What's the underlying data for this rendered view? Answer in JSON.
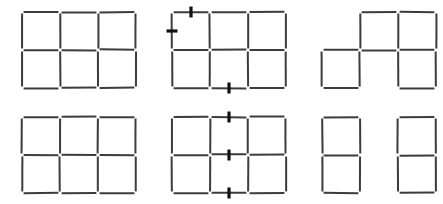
{
  "figure": {
    "title": "",
    "background": "#ffffff",
    "stick_color": "#3c3c3c",
    "mark_color": "#111111",
    "rows": 2,
    "columns": 3,
    "panel_labels": [
      "",
      "",
      "",
      "",
      "",
      ""
    ]
  },
  "geometry": {
    "cell": 38,
    "stick_width": 2.0,
    "mark_width": 3.2,
    "mark_length": 11,
    "panel_positions": [
      {
        "x": 18,
        "y": 8
      },
      {
        "x": 168,
        "y": 8
      },
      {
        "x": 318,
        "y": 8
      },
      {
        "x": 18,
        "y": 113
      },
      {
        "x": 168,
        "y": 113
      },
      {
        "x": 318,
        "y": 113
      }
    ]
  },
  "panels": [
    {
      "name": "start-grid-top",
      "caption": "",
      "horizontals": [
        {
          "row": 0,
          "col": 0
        },
        {
          "row": 0,
          "col": 1
        },
        {
          "row": 0,
          "col": 2
        },
        {
          "row": 1,
          "col": 0
        },
        {
          "row": 1,
          "col": 1
        },
        {
          "row": 1,
          "col": 2
        },
        {
          "row": 2,
          "col": 0
        },
        {
          "row": 2,
          "col": 1
        },
        {
          "row": 2,
          "col": 2
        }
      ],
      "verticals": [
        {
          "row": 0,
          "col": 0
        },
        {
          "row": 0,
          "col": 1
        },
        {
          "row": 0,
          "col": 2
        },
        {
          "row": 0,
          "col": 3
        },
        {
          "row": 1,
          "col": 0
        },
        {
          "row": 1,
          "col": 1
        },
        {
          "row": 1,
          "col": 2
        },
        {
          "row": 1,
          "col": 3
        }
      ],
      "marks": []
    },
    {
      "name": "marked-grid-top",
      "caption": "",
      "horizontals": [
        {
          "row": 0,
          "col": 0
        },
        {
          "row": 0,
          "col": 1
        },
        {
          "row": 0,
          "col": 2
        },
        {
          "row": 1,
          "col": 0
        },
        {
          "row": 1,
          "col": 1
        },
        {
          "row": 1,
          "col": 2
        },
        {
          "row": 2,
          "col": 0
        },
        {
          "row": 2,
          "col": 1
        },
        {
          "row": 2,
          "col": 2
        }
      ],
      "verticals": [
        {
          "row": 0,
          "col": 0
        },
        {
          "row": 0,
          "col": 1
        },
        {
          "row": 0,
          "col": 2
        },
        {
          "row": 0,
          "col": 3
        },
        {
          "row": 1,
          "col": 0
        },
        {
          "row": 1,
          "col": 1
        },
        {
          "row": 1,
          "col": 2
        },
        {
          "row": 1,
          "col": 3
        }
      ],
      "marks": [
        {
          "on": "horizontal",
          "row": 0,
          "col": 0
        },
        {
          "on": "vertical",
          "row": 0,
          "col": 0
        },
        {
          "on": "horizontal",
          "row": 2,
          "col": 1
        }
      ]
    },
    {
      "name": "result-grid-top",
      "caption": "",
      "horizontals": [
        {
          "row": 0,
          "col": 1
        },
        {
          "row": 0,
          "col": 2
        },
        {
          "row": 1,
          "col": 0
        },
        {
          "row": 1,
          "col": 1
        },
        {
          "row": 1,
          "col": 2
        },
        {
          "row": 2,
          "col": 0
        },
        {
          "row": 2,
          "col": 2
        }
      ],
      "verticals": [
        {
          "row": 0,
          "col": 1
        },
        {
          "row": 0,
          "col": 2
        },
        {
          "row": 0,
          "col": 3
        },
        {
          "row": 1,
          "col": 0
        },
        {
          "row": 1,
          "col": 1
        },
        {
          "row": 1,
          "col": 2
        },
        {
          "row": 1,
          "col": 3
        }
      ],
      "marks": []
    },
    {
      "name": "start-grid-bottom",
      "caption": "",
      "horizontals": [
        {
          "row": 0,
          "col": 0
        },
        {
          "row": 0,
          "col": 1
        },
        {
          "row": 0,
          "col": 2
        },
        {
          "row": 1,
          "col": 0
        },
        {
          "row": 1,
          "col": 1
        },
        {
          "row": 1,
          "col": 2
        },
        {
          "row": 2,
          "col": 0
        },
        {
          "row": 2,
          "col": 1
        },
        {
          "row": 2,
          "col": 2
        }
      ],
      "verticals": [
        {
          "row": 0,
          "col": 0
        },
        {
          "row": 0,
          "col": 1
        },
        {
          "row": 0,
          "col": 2
        },
        {
          "row": 0,
          "col": 3
        },
        {
          "row": 1,
          "col": 0
        },
        {
          "row": 1,
          "col": 1
        },
        {
          "row": 1,
          "col": 2
        },
        {
          "row": 1,
          "col": 3
        }
      ],
      "marks": []
    },
    {
      "name": "marked-grid-bottom",
      "caption": "",
      "horizontals": [
        {
          "row": 0,
          "col": 0
        },
        {
          "row": 0,
          "col": 1
        },
        {
          "row": 0,
          "col": 2
        },
        {
          "row": 1,
          "col": 0
        },
        {
          "row": 1,
          "col": 1
        },
        {
          "row": 1,
          "col": 2
        },
        {
          "row": 2,
          "col": 0
        },
        {
          "row": 2,
          "col": 1
        },
        {
          "row": 2,
          "col": 2
        }
      ],
      "verticals": [
        {
          "row": 0,
          "col": 0
        },
        {
          "row": 0,
          "col": 1
        },
        {
          "row": 0,
          "col": 2
        },
        {
          "row": 0,
          "col": 3
        },
        {
          "row": 1,
          "col": 0
        },
        {
          "row": 1,
          "col": 1
        },
        {
          "row": 1,
          "col": 2
        },
        {
          "row": 1,
          "col": 3
        }
      ],
      "marks": [
        {
          "on": "horizontal",
          "row": 0,
          "col": 1
        },
        {
          "on": "horizontal",
          "row": 1,
          "col": 1
        },
        {
          "on": "horizontal",
          "row": 2,
          "col": 1
        }
      ]
    },
    {
      "name": "result-grid-bottom",
      "caption": "",
      "horizontals": [
        {
          "row": 0,
          "col": 0
        },
        {
          "row": 0,
          "col": 2
        },
        {
          "row": 1,
          "col": 0
        },
        {
          "row": 1,
          "col": 2
        },
        {
          "row": 2,
          "col": 0
        },
        {
          "row": 2,
          "col": 2
        }
      ],
      "verticals": [
        {
          "row": 0,
          "col": 0
        },
        {
          "row": 0,
          "col": 1
        },
        {
          "row": 0,
          "col": 2
        },
        {
          "row": 0,
          "col": 3
        },
        {
          "row": 1,
          "col": 0
        },
        {
          "row": 1,
          "col": 1
        },
        {
          "row": 1,
          "col": 2
        },
        {
          "row": 1,
          "col": 3
        }
      ],
      "marks": []
    }
  ]
}
